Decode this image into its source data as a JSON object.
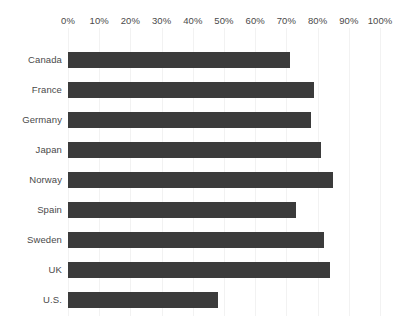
{
  "chart_data": {
    "type": "bar",
    "orientation": "horizontal",
    "title": "",
    "subtitle": "",
    "xlabel": "",
    "ylabel": "",
    "xlim": [
      0,
      100
    ],
    "grid": true,
    "legend": null,
    "legend_position": "none",
    "axis_position": "top",
    "value_suffix": "%",
    "categories": [
      "Canada",
      "France",
      "Germany",
      "Japan",
      "Norway",
      "Spain",
      "Sweden",
      "UK",
      "U.S."
    ],
    "values": [
      71,
      79,
      78,
      81,
      85,
      73,
      82,
      84,
      48
    ],
    "tick_labels": [
      "0%",
      "10%",
      "20%",
      "30%",
      "40%",
      "50%",
      "60%",
      "70%",
      "80%",
      "90%",
      "100%"
    ],
    "ticks": [
      0,
      10,
      20,
      30,
      40,
      50,
      60,
      70,
      80,
      90,
      100
    ],
    "bars": [
      {
        "category": "Canada",
        "value": 71
      },
      {
        "category": "France",
        "value": 79
      },
      {
        "category": "Germany",
        "value": 78
      },
      {
        "category": "Japan",
        "value": 81
      },
      {
        "category": "Norway",
        "value": 85
      },
      {
        "category": "Spain",
        "value": 73
      },
      {
        "category": "Sweden",
        "value": 82
      },
      {
        "category": "UK",
        "value": 84
      },
      {
        "category": "U.S.",
        "value": 48
      }
    ]
  },
  "colors": {
    "bar": "#3b3b3b",
    "gridline": "#f2f2f2",
    "text": "#4a4a4a",
    "background": "#ffffff"
  }
}
